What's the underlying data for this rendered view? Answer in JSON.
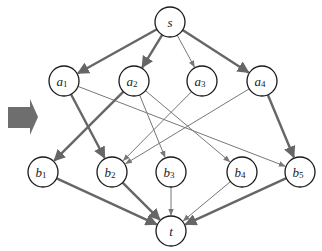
{
  "diagram": {
    "type": "flow-network",
    "colors": {
      "edge": "#666666",
      "node_stroke": "#1a1a1a",
      "arrow_block": "#6e6e6e"
    },
    "left_arrow": {
      "icon": "right-block-arrow-icon"
    },
    "nodes": [
      {
        "id": "s",
        "label": "s",
        "sub": "",
        "x": 170,
        "y": 22
      },
      {
        "id": "a1",
        "label": "a",
        "sub": "1",
        "x": 64,
        "y": 81
      },
      {
        "id": "a2",
        "label": "a",
        "sub": "2",
        "x": 134,
        "y": 81
      },
      {
        "id": "a3",
        "label": "a",
        "sub": "3",
        "x": 202,
        "y": 81
      },
      {
        "id": "a4",
        "label": "a",
        "sub": "4",
        "x": 262,
        "y": 81
      },
      {
        "id": "b1",
        "label": "b",
        "sub": "1",
        "x": 43,
        "y": 172
      },
      {
        "id": "b2",
        "label": "b",
        "sub": "2",
        "x": 112,
        "y": 172
      },
      {
        "id": "b3",
        "label": "b",
        "sub": "3",
        "x": 171,
        "y": 172
      },
      {
        "id": "b4",
        "label": "b",
        "sub": "4",
        "x": 242,
        "y": 172
      },
      {
        "id": "b5",
        "label": "b",
        "sub": "5",
        "x": 300,
        "y": 172
      },
      {
        "id": "t",
        "label": "t",
        "sub": "",
        "x": 171,
        "y": 231
      }
    ],
    "edges": [
      {
        "from": "s",
        "to": "a1",
        "weight": "thick"
      },
      {
        "from": "s",
        "to": "a2",
        "weight": "thick"
      },
      {
        "from": "s",
        "to": "a3",
        "weight": "thin"
      },
      {
        "from": "s",
        "to": "a4",
        "weight": "thick"
      },
      {
        "from": "a1",
        "to": "b2",
        "weight": "thick"
      },
      {
        "from": "a1",
        "to": "b5",
        "weight": "thin"
      },
      {
        "from": "a2",
        "to": "b1",
        "weight": "thick"
      },
      {
        "from": "a2",
        "to": "b3",
        "weight": "thin"
      },
      {
        "from": "a2",
        "to": "b4",
        "weight": "thin"
      },
      {
        "from": "a3",
        "to": "b2",
        "weight": "thin"
      },
      {
        "from": "a4",
        "to": "b2",
        "weight": "thin"
      },
      {
        "from": "a4",
        "to": "b5",
        "weight": "thick"
      },
      {
        "from": "b1",
        "to": "t",
        "weight": "thick"
      },
      {
        "from": "b2",
        "to": "t",
        "weight": "thick"
      },
      {
        "from": "b3",
        "to": "t",
        "weight": "thin"
      },
      {
        "from": "b4",
        "to": "t",
        "weight": "thin"
      },
      {
        "from": "b5",
        "to": "t",
        "weight": "thick"
      }
    ]
  }
}
